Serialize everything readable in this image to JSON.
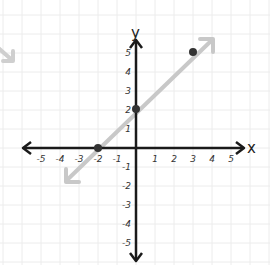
{
  "chart_data": {
    "type": "line",
    "title": "",
    "xlabel": "x",
    "ylabel": "y",
    "xlim": [
      -5,
      5
    ],
    "ylim": [
      -5,
      5
    ],
    "grid": true,
    "x_ticks": [
      -5,
      -4,
      -3,
      -2,
      -1,
      1,
      2,
      3,
      4,
      5
    ],
    "y_ticks": [
      5,
      4,
      3,
      2,
      1,
      -1,
      -2,
      -3,
      -4,
      -5
    ],
    "series": [
      {
        "name": "line y = x + 2",
        "kind": "line-with-arrows",
        "points": [
          [
            -2,
            0
          ],
          [
            0,
            2
          ],
          [
            3,
            5
          ]
        ],
        "color": "#c8c8c8"
      }
    ],
    "marked_points": [
      {
        "x": -2,
        "y": 0
      },
      {
        "x": 0,
        "y": 2
      },
      {
        "x": 3,
        "y": 5
      }
    ],
    "decorations": [
      {
        "type": "partial-arrow",
        "position": "left edge, near y=4",
        "color": "#c8c8c8"
      }
    ]
  },
  "labels": {
    "x_axis": "x",
    "y_axis": "y",
    "x_ticks": [
      "-5",
      "-4",
      "-3",
      "-2",
      "-1",
      "1",
      "2",
      "3",
      "4",
      "5"
    ],
    "y_ticks": [
      "5",
      "4",
      "3",
      "2",
      "1",
      "-1",
      "-2",
      "-3",
      "-4",
      "-5"
    ]
  },
  "colors": {
    "axis": "#1a1a1a",
    "grid": "#ececec",
    "line": "#c8c8c8",
    "point": "#333333"
  }
}
